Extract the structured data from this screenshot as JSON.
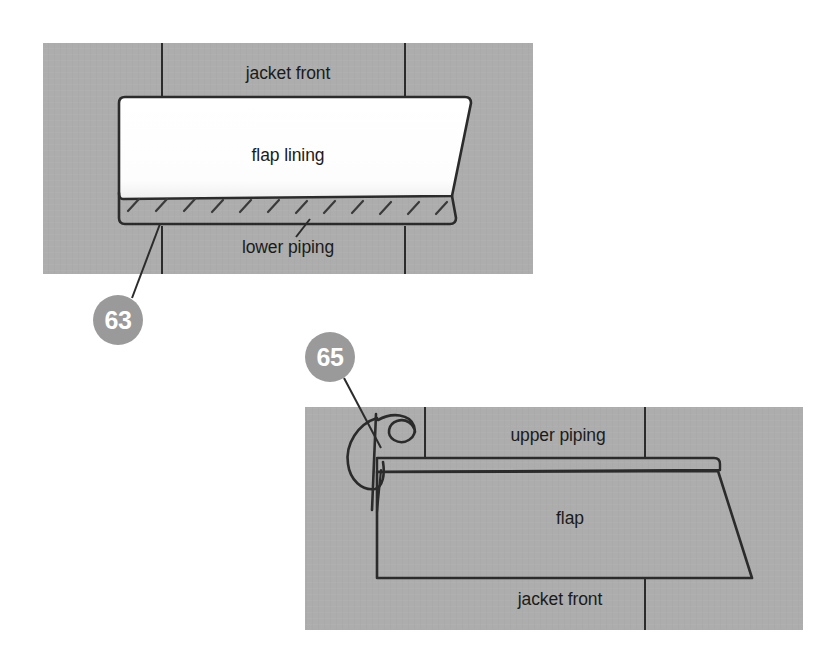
{
  "document": {
    "type": "tailoring-instruction-illustration",
    "subject": "Attaching a jacket pocket flap between upper and lower piping",
    "background_color": "#ffffff",
    "fabric_color": "#adadad",
    "lining_color": "#ffffff",
    "ink_color": "#1b1b1b",
    "badge_color": "#9a9a9a",
    "badge_text_color": "#ffffff"
  },
  "figures": [
    {
      "id": "figure-63",
      "step_number": "63",
      "panel": {
        "x": 43,
        "y": 43,
        "width": 490,
        "height": 231
      },
      "labels": [
        {
          "name": "jacket-front",
          "text": "jacket front",
          "x": 288,
          "y": 79
        },
        {
          "name": "flap-lining",
          "text": "flap lining",
          "x": 288,
          "y": 161
        },
        {
          "name": "lower-piping",
          "text": "lower piping",
          "x": 288,
          "y": 253
        }
      ],
      "parts": [
        {
          "name": "flap-lining-piece",
          "fill": "#ffffff"
        },
        {
          "name": "lower-piping-strip",
          "fill": "#adadad"
        }
      ],
      "stitch_count": 12,
      "badge": {
        "cx": 118,
        "cy": 320,
        "r": 25,
        "label": "63"
      }
    },
    {
      "id": "figure-65",
      "step_number": "65",
      "panel": {
        "x": 305,
        "y": 407,
        "width": 498,
        "height": 223
      },
      "labels": [
        {
          "name": "upper-piping",
          "text": "upper piping",
          "x": 558,
          "y": 441
        },
        {
          "name": "flap",
          "text": "flap",
          "x": 570,
          "y": 524
        },
        {
          "name": "jacket-front",
          "text": "jacket front",
          "x": 560,
          "y": 605
        }
      ],
      "parts": [
        {
          "name": "upper-piping-strip",
          "fill": "#adadad"
        },
        {
          "name": "flap-piece",
          "fill": "#adadad"
        },
        {
          "name": "needle-and-thread",
          "fill": "none"
        }
      ],
      "badge": {
        "cx": 330,
        "cy": 357,
        "r": 25,
        "label": "65"
      }
    }
  ]
}
